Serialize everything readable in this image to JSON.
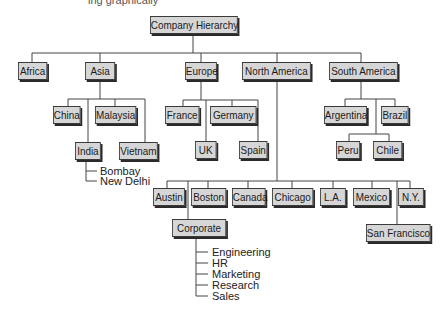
{
  "header": {
    "cropped_text": "ing graphically"
  },
  "diagram": {
    "title": "Company Hierarchy",
    "root": "Company Hierarchy",
    "regions": [
      {
        "label": "Africa",
        "children": []
      },
      {
        "label": "Asia",
        "children": [
          {
            "label": "China"
          },
          {
            "label": "Malaysia"
          },
          {
            "label": "India",
            "leaves": [
              "Bombay",
              "New Delhi"
            ]
          },
          {
            "label": "Vietnam"
          }
        ]
      },
      {
        "label": "Europe",
        "children": [
          {
            "label": "France"
          },
          {
            "label": "Germany"
          },
          {
            "label": "UK"
          },
          {
            "label": "Spain"
          }
        ]
      },
      {
        "label": "North America",
        "children": [
          {
            "label": "Austin"
          },
          {
            "label": "Boston"
          },
          {
            "label": "Canada"
          },
          {
            "label": "Chicago"
          },
          {
            "label": "L.A."
          },
          {
            "label": "Mexico"
          },
          {
            "label": "N.Y."
          },
          {
            "label": "Corporate",
            "leaves": [
              "Engineering",
              "HR",
              "Marketing",
              "Research",
              "Sales"
            ]
          },
          {
            "label": "San Francisco"
          }
        ]
      },
      {
        "label": "South America",
        "children": [
          {
            "label": "Argentina"
          },
          {
            "label": "Brazil"
          },
          {
            "label": "Peru"
          },
          {
            "label": "Chile"
          }
        ]
      }
    ]
  },
  "colors": {
    "node_fill": "#d6d6d6",
    "node_border": "#3a3a3a",
    "line": "#444444"
  }
}
